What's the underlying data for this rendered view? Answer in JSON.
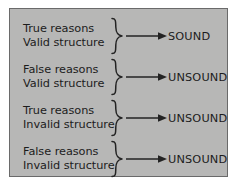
{
  "diagram": {
    "panel": {
      "background_color": "#b7b7b6",
      "border_color": "#6a6a6a",
      "text_color": "#1c1c1c"
    },
    "connector": {
      "brace_glyph": "}",
      "arrow_glyph": "→"
    },
    "rows": [
      {
        "reasons": "True reasons",
        "structure": "Valid structure",
        "verdict": "SOUND"
      },
      {
        "reasons": "False reasons",
        "structure": "Valid structure",
        "verdict": "UNSOUND"
      },
      {
        "reasons": "True reasons",
        "structure": "Invalid structure",
        "verdict": "UNSOUND"
      },
      {
        "reasons": "False reasons",
        "structure": "Invalid structure",
        "verdict": "UNSOUND"
      }
    ]
  }
}
